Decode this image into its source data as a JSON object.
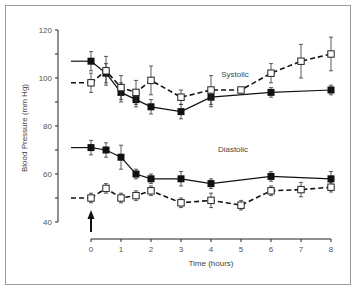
{
  "chart_data": {
    "type": "line",
    "title": "",
    "xlabel": "Time (hours)",
    "ylabel": "Blood Pressure (mm Hg)",
    "xlim": [
      0,
      8
    ],
    "ylim": [
      40,
      120
    ],
    "x_ticks": [
      "0",
      "1",
      "2",
      "3",
      "4",
      "5",
      "6",
      "7",
      "8"
    ],
    "y_ticks": [
      "40",
      "60",
      "80",
      "100",
      "120"
    ],
    "grid": false,
    "legend": "none",
    "annotations": [
      "Systolic",
      "Diastolic",
      "upward arrow at time 0 (dosing)"
    ],
    "series": [
      {
        "name": "Systolic (filled squares, solid line)",
        "marker": "filled-square",
        "line": "solid",
        "x": [
          0,
          0.5,
          1,
          1.5,
          2,
          3,
          4,
          6,
          8
        ],
        "values": [
          107,
          102,
          94,
          91,
          88,
          86,
          92,
          94,
          95
        ],
        "err": [
          4,
          4,
          4,
          3,
          3,
          3,
          4,
          2,
          2
        ]
      },
      {
        "name": "Systolic (open squares, dashed line)",
        "marker": "open-square",
        "line": "dashed",
        "x": [
          0,
          0.5,
          1,
          1.5,
          2,
          3,
          4,
          5,
          6,
          7,
          8
        ],
        "values": [
          98,
          103,
          96,
          94,
          99,
          92,
          95,
          95,
          102,
          107,
          110
        ],
        "err": [
          4,
          6,
          5,
          5,
          6,
          3,
          6,
          1,
          4,
          7,
          7
        ]
      },
      {
        "name": "Diastolic (filled squares, solid line)",
        "marker": "filled-square",
        "line": "solid",
        "x": [
          0,
          0.5,
          1,
          1.5,
          2,
          3,
          4,
          6,
          8
        ],
        "values": [
          71,
          70,
          67,
          60,
          58,
          58,
          56,
          59,
          58
        ],
        "err": [
          3,
          3,
          5,
          2,
          2,
          3,
          2,
          2,
          3
        ]
      },
      {
        "name": "Diastolic (open squares, dashed line)",
        "marker": "open-square",
        "line": "dashed",
        "x": [
          0,
          0.5,
          1,
          1.5,
          2,
          3,
          4,
          5,
          6,
          7,
          8
        ],
        "values": [
          50,
          54,
          50,
          51,
          53,
          48,
          49,
          47,
          53,
          53.5,
          54.5
        ],
        "err": [
          2,
          2,
          2,
          2,
          2,
          2,
          3,
          2,
          2,
          3,
          2
        ]
      }
    ]
  },
  "labels": {
    "systolic": "Systolic",
    "diastolic": "Diastolic",
    "xlabel": "Time (hours)",
    "ylabel": "Blood Pressure (mm Hg)"
  }
}
